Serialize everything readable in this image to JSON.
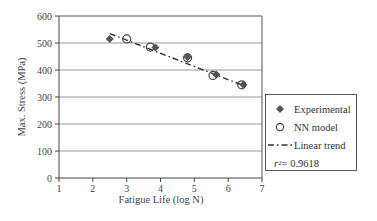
{
  "chart_data": {
    "type": "scatter",
    "title": "",
    "xlabel": "Fatigue Life (log N)",
    "ylabel": "Max. Stress (MPa)",
    "xlim": [
      1,
      7
    ],
    "ylim": [
      0,
      600
    ],
    "x_ticks": [
      "1",
      "2",
      "3",
      "4",
      "5",
      "6",
      "7"
    ],
    "y_ticks": [
      "0",
      "100",
      "200",
      "300",
      "400",
      "500",
      "600"
    ],
    "grid": "horizontal",
    "legend_position": "right",
    "series": [
      {
        "name": "Experimental",
        "marker": "filled-diamond",
        "x": [
          2.5,
          3.85,
          4.8,
          5.65,
          6.45
        ],
        "y": [
          515,
          483,
          448,
          383,
          345
        ]
      },
      {
        "name": "NN model",
        "marker": "open-circle",
        "x": [
          3.0,
          3.7,
          4.8,
          5.55,
          6.4
        ],
        "y": [
          515,
          485,
          445,
          380,
          345
        ]
      },
      {
        "name": "Linear trend",
        "line": "dash-dot",
        "x": [
          2.5,
          6.5
        ],
        "y": [
          535,
          340
        ]
      }
    ],
    "annotation": "r2 = 0.9618"
  },
  "legend": {
    "items": [
      {
        "label": "Experimental"
      },
      {
        "label": "NN model"
      },
      {
        "label": "Linear trend"
      }
    ],
    "r2_label": "r",
    "r2_sup": "2",
    "r2_value": " = 0.9618"
  },
  "axes": {
    "xlabel": "Fatigue Life (log N)",
    "ylabel": "Max. Stress (MPa)"
  }
}
